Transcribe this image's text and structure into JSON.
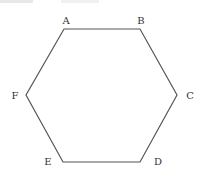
{
  "diagram": {
    "type": "regular-hexagon",
    "stroke_color": "#555555",
    "vertices": [
      {
        "label": "A",
        "x": 64,
        "y": 29,
        "lx": 66,
        "ly": 24
      },
      {
        "label": "B",
        "x": 140,
        "y": 29,
        "lx": 141,
        "ly": 24
      },
      {
        "label": "C",
        "x": 177,
        "y": 95,
        "lx": 190,
        "ly": 99
      },
      {
        "label": "D",
        "x": 140,
        "y": 162,
        "lx": 158,
        "ly": 165
      },
      {
        "label": "E",
        "x": 63,
        "y": 162,
        "lx": 48,
        "ly": 165
      },
      {
        "label": "F",
        "x": 26,
        "y": 95,
        "lx": 15,
        "ly": 99
      }
    ]
  }
}
